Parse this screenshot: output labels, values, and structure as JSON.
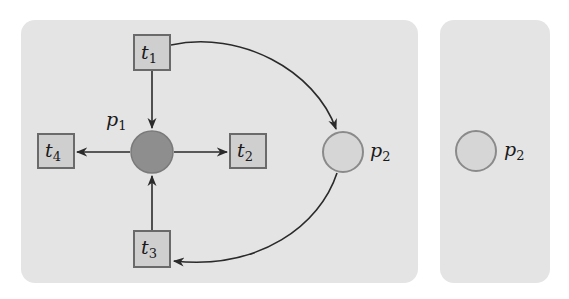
{
  "diagram": {
    "type": "petri-net",
    "colors": {
      "panel_bg": "#e4e4e4",
      "transition_fill": "#cfcfcf",
      "transition_stroke": "#6a6a6a",
      "place_marked_fill": "#8e8e8e",
      "place_empty_fill": "#d6d6d6",
      "place_empty_stroke": "#8a8a8a",
      "arc_color": "#2a2a2a"
    },
    "left_panel": {
      "transitions": [
        {
          "id": "t1",
          "base": "t",
          "sub": "1"
        },
        {
          "id": "t2",
          "base": "t",
          "sub": "2"
        },
        {
          "id": "t3",
          "base": "t",
          "sub": "3"
        },
        {
          "id": "t4",
          "base": "t",
          "sub": "4"
        }
      ],
      "places": [
        {
          "id": "p1",
          "base": "p",
          "sub": "1",
          "marked": true
        },
        {
          "id": "p2",
          "base": "p",
          "sub": "2",
          "marked": false
        }
      ],
      "arcs": [
        {
          "from": "t1",
          "to": "p1"
        },
        {
          "from": "t1",
          "to": "p2"
        },
        {
          "from": "p1",
          "to": "t2"
        },
        {
          "from": "p1",
          "to": "t4"
        },
        {
          "from": "t3",
          "to": "p1"
        },
        {
          "from": "p2",
          "to": "t3"
        }
      ]
    },
    "right_panel": {
      "places": [
        {
          "id": "p2",
          "base": "p",
          "sub": "2",
          "marked": false
        }
      ]
    }
  }
}
